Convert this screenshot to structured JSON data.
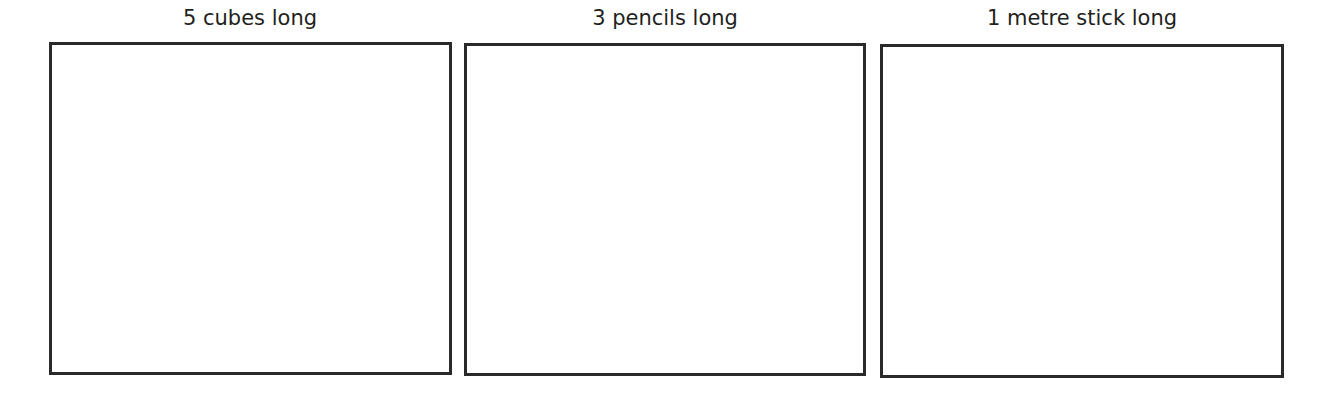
{
  "panels": [
    {
      "label": "5 cubes long"
    },
    {
      "label": "3 pencils long"
    },
    {
      "label": "1 metre stick long"
    }
  ]
}
